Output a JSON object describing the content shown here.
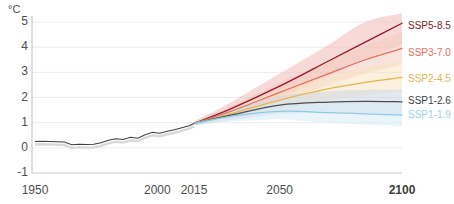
{
  "chart_data": {
    "type": "line",
    "title": "",
    "subtitle": "",
    "xlabel": "",
    "ylabel": "",
    "unit_label": "°C",
    "xlim": [
      1950,
      2100
    ],
    "ylim": [
      -1,
      5.4
    ],
    "yticks": [
      5,
      4,
      3,
      2,
      1,
      0,
      -1
    ],
    "ytick_labels": [
      "5",
      "4",
      "3",
      "2",
      "1",
      "0",
      "-1"
    ],
    "xticks": [
      1950,
      2000,
      2015,
      2050,
      2100
    ],
    "xtick_labels": [
      "1950",
      "2000",
      "2015",
      "2050",
      "2100"
    ],
    "grid": true,
    "legend_position": "right",
    "historical": {
      "name": "historical",
      "color": "#3f3f3f",
      "x": [
        1950,
        1953,
        1956,
        1959,
        1962,
        1965,
        1968,
        1971,
        1974,
        1977,
        1980,
        1983,
        1986,
        1989,
        1992,
        1995,
        1998,
        2001,
        2004,
        2007,
        2010,
        2013,
        2015
      ],
      "values": [
        0.25,
        0.26,
        0.25,
        0.24,
        0.23,
        0.12,
        0.14,
        0.13,
        0.14,
        0.2,
        0.3,
        0.36,
        0.33,
        0.42,
        0.38,
        0.52,
        0.62,
        0.58,
        0.66,
        0.72,
        0.8,
        0.88,
        0.97
      ]
    },
    "series": [
      {
        "name": "SSP5-8.5",
        "color": "#98182c",
        "band_color": "#f0b5b0",
        "label_color": "#7a2320",
        "x": [
          2015,
          2030,
          2050,
          2070,
          2085,
          2100
        ],
        "values": [
          0.97,
          1.55,
          2.45,
          3.45,
          4.2,
          4.95
        ],
        "band_low": [
          0.9,
          1.3,
          2.0,
          2.85,
          3.5,
          4.1
        ],
        "band_high": [
          1.05,
          1.8,
          2.95,
          4.1,
          5.0,
          5.35
        ],
        "label_y_value": 4.85
      },
      {
        "name": "SSP3-7.0",
        "color": "#e4705e",
        "band_color": "#f5c8bd",
        "label_color": "#e4705e",
        "x": [
          2015,
          2030,
          2050,
          2070,
          2085,
          2100
        ],
        "values": [
          0.97,
          1.45,
          2.2,
          2.95,
          3.5,
          3.95
        ],
        "band_low": [
          0.9,
          1.25,
          1.85,
          2.5,
          2.95,
          3.3
        ],
        "band_high": [
          1.05,
          1.65,
          2.6,
          3.45,
          4.05,
          4.6
        ],
        "label_y_value": 3.75
      },
      {
        "name": "SSP2-4.5",
        "color": "#e8b44c",
        "band_color": "#f7e3bd",
        "label_color": "#e3b356",
        "x": [
          2015,
          2030,
          2050,
          2070,
          2085,
          2100
        ],
        "values": [
          0.97,
          1.35,
          1.9,
          2.35,
          2.6,
          2.8
        ],
        "band_low": [
          0.9,
          1.15,
          1.55,
          1.9,
          2.1,
          2.25
        ],
        "band_high": [
          1.05,
          1.55,
          2.3,
          2.85,
          3.2,
          3.45
        ],
        "label_y_value": 2.72
      },
      {
        "name": "SSP1-2.6",
        "color": "#4d4d4d",
        "band_color": "#c8d4e4",
        "label_color": "#3d3d3d",
        "x": [
          2015,
          2030,
          2050,
          2070,
          2085,
          2100
        ],
        "values": [
          0.97,
          1.3,
          1.7,
          1.82,
          1.85,
          1.83
        ],
        "band_low": [
          0.9,
          1.1,
          1.35,
          1.4,
          1.38,
          1.32
        ],
        "band_high": [
          1.05,
          1.5,
          2.05,
          2.25,
          2.3,
          2.3
        ],
        "label_y_value": 1.85
      },
      {
        "name": "SSP1-1.9",
        "color": "#8ecae6",
        "band_color": "#d5ebf6",
        "label_color": "#9ed0e8",
        "x": [
          2015,
          2030,
          2050,
          2070,
          2085,
          2100
        ],
        "values": [
          0.97,
          1.25,
          1.45,
          1.4,
          1.35,
          1.3
        ],
        "band_low": [
          0.9,
          1.05,
          1.15,
          1.0,
          0.92,
          0.85
        ],
        "band_high": [
          1.05,
          1.45,
          1.78,
          1.78,
          1.75,
          1.72
        ],
        "label_y_value": 1.32
      }
    ],
    "axis_color": "#8d8d8d",
    "grid_color": "#ececec"
  },
  "legend": {
    "items": [
      {
        "label": "SSP5-8.5"
      },
      {
        "label": "SSP3-7.0"
      },
      {
        "label": "SSP2-4.5"
      },
      {
        "label": "SSP1-2.6"
      },
      {
        "label": "SSP1-1.9"
      }
    ]
  }
}
